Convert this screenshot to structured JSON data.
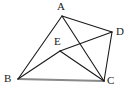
{
  "figure": {
    "kind": "plane-geometry-diagram",
    "canvas": {
      "width": 136,
      "height": 95,
      "background": "#ffffff"
    },
    "style": {
      "stroke_color": "#1a1a1a",
      "stroke_width": 1.1,
      "baseline_color": "#8a8a8a",
      "baseline_width": 2.0,
      "label_color": "#1a1a1a",
      "label_font_size": 11
    },
    "points": [
      {
        "id": "A",
        "label": "A",
        "x": 62,
        "y": 16,
        "label_x": 57,
        "label_y": 1,
        "role": "vertex"
      },
      {
        "id": "D",
        "label": "D",
        "x": 112,
        "y": 32,
        "label_x": 116,
        "label_y": 26,
        "role": "vertex"
      },
      {
        "id": "E",
        "label": "E",
        "x": 60,
        "y": 51,
        "label_x": 54,
        "label_y": 36,
        "role": "interior-point"
      },
      {
        "id": "B",
        "label": "B",
        "x": 18,
        "y": 79,
        "label_x": 4,
        "label_y": 73,
        "role": "vertex"
      },
      {
        "id": "C",
        "label": "C",
        "x": 104,
        "y": 81,
        "label_x": 107,
        "label_y": 75,
        "role": "vertex"
      }
    ],
    "segments": [
      {
        "id": "AB",
        "from": "A",
        "to": "B",
        "kind": "side"
      },
      {
        "id": "AD",
        "from": "A",
        "to": "D",
        "kind": "side"
      },
      {
        "id": "DC",
        "from": "D",
        "to": "C",
        "kind": "side"
      },
      {
        "id": "BC",
        "from": "B",
        "to": "C",
        "kind": "baseline"
      },
      {
        "id": "AC",
        "from": "A",
        "to": "C",
        "kind": "diagonal"
      },
      {
        "id": "EB",
        "from": "E",
        "to": "B",
        "kind": "cevian"
      },
      {
        "id": "EC",
        "from": "E",
        "to": "C",
        "kind": "cevian"
      },
      {
        "id": "ED",
        "from": "E",
        "to": "D",
        "kind": "cevian"
      }
    ]
  }
}
